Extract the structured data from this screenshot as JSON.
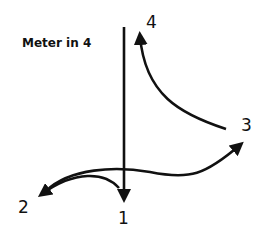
{
  "diagram": {
    "title": "Meter in 4",
    "beats": [
      {
        "label": "1",
        "x": 118,
        "y": 210
      },
      {
        "label": "2",
        "x": 18,
        "y": 199
      },
      {
        "label": "3",
        "x": 241,
        "y": 117
      },
      {
        "label": "4",
        "x": 146,
        "y": 14
      }
    ],
    "stroke_color": "#111111"
  }
}
